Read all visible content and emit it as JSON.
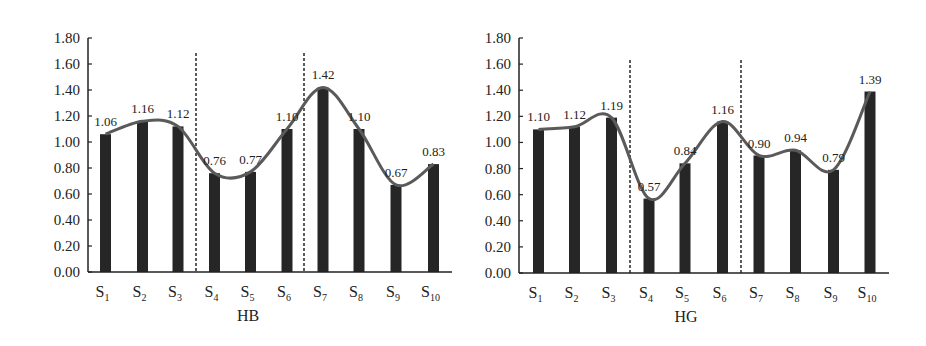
{
  "chart_data": [
    {
      "type": "bar",
      "title": "HB",
      "xlabel": "HB",
      "ylabel": "",
      "ylim": [
        0,
        1.8
      ],
      "yticks": [
        "0.00",
        "0.20",
        "0.40",
        "0.60",
        "0.80",
        "1.00",
        "1.20",
        "1.40",
        "1.60",
        "1.80"
      ],
      "categories": [
        "S1",
        "S2",
        "S3",
        "S4",
        "S5",
        "S6",
        "S7",
        "S8",
        "S9",
        "S10"
      ],
      "values": [
        1.06,
        1.16,
        1.12,
        0.76,
        0.77,
        1.1,
        1.42,
        1.1,
        0.67,
        0.83
      ],
      "value_labels": [
        "1.06",
        "1.16",
        "1.12",
        "0.76",
        "0.77",
        "1.10",
        "1.42",
        "1.10",
        "0.67",
        "0.83"
      ],
      "overlay": "smoothed line through bar tops",
      "dividers_after": [
        "S3",
        "S6"
      ],
      "grid": false,
      "legend": null
    },
    {
      "type": "bar",
      "title": "HG",
      "xlabel": "HG",
      "ylabel": "",
      "ylim": [
        0,
        1.8
      ],
      "yticks": [
        "0.00",
        "0.20",
        "0.40",
        "0.60",
        "0.80",
        "1.00",
        "1.20",
        "1.40",
        "1.60",
        "1.80"
      ],
      "categories": [
        "S1",
        "S2",
        "S3",
        "S4",
        "S5",
        "S6",
        "S7",
        "S8",
        "S9",
        "S10"
      ],
      "values": [
        1.1,
        1.12,
        1.19,
        0.57,
        0.84,
        1.16,
        0.9,
        0.94,
        0.79,
        1.39
      ],
      "value_labels": [
        "1.10",
        "1.12",
        "1.19",
        "0.57",
        "0.84",
        "1.16",
        "0.90",
        "0.94",
        "0.79",
        "1.39"
      ],
      "overlay": "smoothed line through bar tops",
      "dividers_after": [
        "S3",
        "S6"
      ],
      "grid": false,
      "legend": null
    }
  ],
  "colors": {
    "bar": "#262626",
    "line": "#5a5a5a",
    "axis": "#222222",
    "divider": "#333333"
  }
}
